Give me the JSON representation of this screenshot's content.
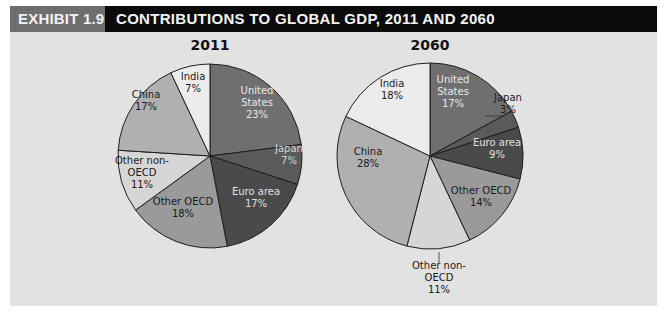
{
  "header": {
    "exhibit_label": "EXHIBIT 1.9",
    "title": "CONTRIBUTIONS TO GLOBAL GDP, 2011 AND 2060"
  },
  "colors": {
    "exhibit_bg": "#6e6e6e",
    "title_bg": "#0a0a0a",
    "panel_bg": "#e2e2e2"
  },
  "chart_data": [
    {
      "type": "pie",
      "title": "2011",
      "categories": [
        "United States",
        "Japan",
        "Euro area",
        "Other OECD",
        "Other non-OECD",
        "China",
        "India"
      ],
      "values": [
        23,
        7,
        17,
        18,
        11,
        17,
        7
      ],
      "unit": "%",
      "start_angle": "12 o'clock",
      "direction": "clockwise",
      "center": [
        210,
        156
      ],
      "radius": 92,
      "slices": [
        {
          "name": "United States",
          "lines": [
            "United",
            "States",
            "23%"
          ],
          "value": 23,
          "color": "#6f6f6f",
          "text": "#e8e8e8"
        },
        {
          "name": "Japan",
          "lines": [
            "Japan",
            "7%"
          ],
          "value": 7,
          "color": "#5a5a5a",
          "text": "#d8d8d8"
        },
        {
          "name": "Euro area",
          "lines": [
            "Euro area",
            "17%"
          ],
          "value": 17,
          "color": "#4a4a4a",
          "text": "#e0e0e0"
        },
        {
          "name": "Other OECD",
          "lines": [
            "Other OECD",
            "18%"
          ],
          "value": 18,
          "color": "#9a9a9a",
          "text": "#1a1a1a"
        },
        {
          "name": "Other non-OECD",
          "lines": [
            "Other non-",
            "OECD",
            "11%"
          ],
          "value": 11,
          "color": "#d6d6d6",
          "text": "#1a1a1a"
        },
        {
          "name": "China",
          "lines": [
            "China",
            "17%"
          ],
          "value": 17,
          "color": "#b0b0b0",
          "text": "#1a1a1a"
        },
        {
          "name": "India",
          "lines": [
            "India",
            "7%"
          ],
          "value": 7,
          "color": "#ececec",
          "text": "#1a1a1a"
        }
      ]
    },
    {
      "type": "pie",
      "title": "2060",
      "categories": [
        "United States",
        "Japan",
        "Euro area",
        "Other OECD",
        "Other non-OECD",
        "China",
        "India"
      ],
      "values": [
        17,
        3,
        9,
        14,
        11,
        28,
        18
      ],
      "unit": "%",
      "start_angle": "12 o'clock",
      "direction": "clockwise",
      "center": [
        430,
        156
      ],
      "radius": 93,
      "slices": [
        {
          "name": "United States",
          "lines": [
            "United",
            "States",
            "17%"
          ],
          "value": 17,
          "color": "#6f6f6f",
          "text": "#e8e8e8"
        },
        {
          "name": "Japan",
          "lines": [
            "Japan",
            "3%"
          ],
          "value": 3,
          "color": "#5a5a5a",
          "text": "#1a1a1a",
          "external": true
        },
        {
          "name": "Euro area",
          "lines": [
            "Euro area",
            "9%"
          ],
          "value": 9,
          "color": "#4a4a4a",
          "text": "#e0e0e0"
        },
        {
          "name": "Other OECD",
          "lines": [
            "Other OECD",
            "14%"
          ],
          "value": 14,
          "color": "#9a9a9a",
          "text": "#1a1a1a"
        },
        {
          "name": "Other non-OECD",
          "lines": [
            "Other non-",
            "OECD",
            "11%"
          ],
          "value": 11,
          "color": "#d6d6d6",
          "text": "#1a1a1a",
          "external": true
        },
        {
          "name": "China",
          "lines": [
            "China",
            "28%"
          ],
          "value": 28,
          "color": "#b0b0b0",
          "text": "#1a1a1a"
        },
        {
          "name": "India",
          "lines": [
            "India",
            "18%"
          ],
          "value": 18,
          "color": "#ececec",
          "text": "#1a1a1a"
        }
      ]
    }
  ],
  "label_positions": {
    "0": [
      [
        257,
        103
      ],
      [
        289,
        155
      ],
      [
        256,
        198
      ],
      [
        183,
        208
      ],
      [
        142,
        173
      ],
      [
        146,
        101
      ],
      [
        193,
        83
      ]
    ],
    "1": [
      [
        453,
        92
      ],
      [
        508,
        104
      ],
      [
        497,
        149
      ],
      [
        481,
        197
      ],
      [
        439,
        278
      ],
      [
        368,
        158
      ],
      [
        392,
        90
      ]
    ]
  },
  "external_leaders": {
    "1": {
      "1": {
        "line": [
          [
            485,
            116
          ],
          [
            504,
            116
          ]
        ]
      },
      "4": {
        "line": [
          [
            439,
            252
          ],
          [
            439,
            263
          ]
        ]
      }
    }
  }
}
